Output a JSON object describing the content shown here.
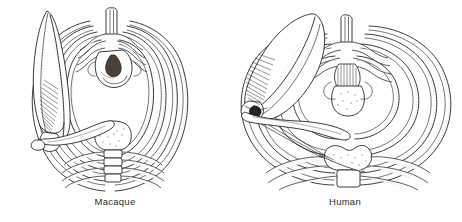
{
  "figure": {
    "kind": "comparative-anatomy-line-drawing",
    "view": "superior view of thorax (ribcage cross-section) with shoulder girdle",
    "background_color": "#ffffff",
    "ink_color": "#1a1a1a",
    "label_color": "#2b2b2b"
  },
  "panels": [
    {
      "id": "macaque",
      "label": "Macaque",
      "label_x": 115,
      "label_y": 202,
      "structures": [
        "scapula",
        "clavicle",
        "ribs",
        "thoracic vertebra",
        "sternum",
        "costal cartilage"
      ]
    },
    {
      "id": "human",
      "label": "Human",
      "label_x": 345,
      "label_y": 202,
      "structures": [
        "scapula",
        "clavicle",
        "ribs",
        "thoracic vertebra",
        "sternum",
        "costal cartilage"
      ]
    }
  ]
}
